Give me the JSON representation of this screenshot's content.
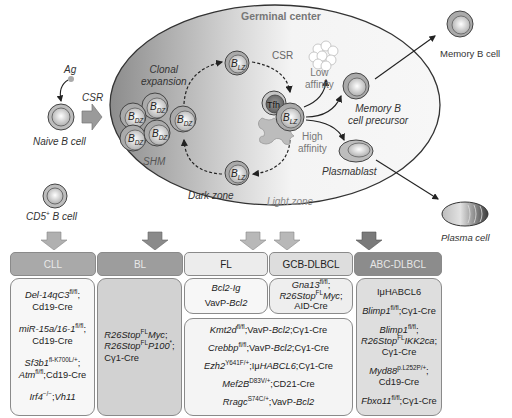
{
  "diagram": {
    "germinal_center": {
      "title": "Germinal center",
      "clonal_expansion": [
        "Clonal",
        "expansion"
      ],
      "shm": "SHM",
      "csr_inner": "CSR",
      "low_affinity": [
        "Low",
        "affinity"
      ],
      "high_affinity": [
        "High",
        "affinity"
      ],
      "dark_zone": "Dark zone",
      "light_zone": "Light zone",
      "tfh": "Tfh",
      "b_dz": "B",
      "b_dz_sub": "DZ",
      "b_lz": "B",
      "b_lz_sub": "LZ"
    },
    "left": {
      "ag": "Ag",
      "csr": "CSR",
      "naive_b_cell": "Naive B cell",
      "cd5_b_cell_prefix": "CD5",
      "cd5_sup": "+",
      "cd5_b_cell_suffix": " B cell"
    },
    "right": {
      "memory_b_cell": "Memory B cell",
      "memory_precursor": [
        "Memory B",
        "cell precursor"
      ],
      "plasmablast": "Plasmablast",
      "plasma_cell": "Plasma cell"
    },
    "colors": {
      "cll_header": "#a9a9a9",
      "bl_header": "#9d9d9d",
      "fl_header": "#ececec",
      "gcb_header": "#dddddd",
      "abc_header": "#8c8c8c",
      "arrow_light": "#b8b8b8",
      "arrow_dark": "#8a8a8a"
    }
  },
  "lymphomas": [
    {
      "name": "CLL",
      "models": [
        {
          "text": "Del-14qC3",
          "sup": "fl/fl",
          "rest": ";",
          "line2": "Cd19-Cre"
        },
        {
          "text": "miR-15a/16-1",
          "sup": "fl/fl",
          "rest": ";",
          "line2": "Cd19-Cre"
        },
        {
          "text": "Sf3b1",
          "sup": "fl-K700L/+",
          "rest": ";",
          "line2a": "Atm",
          "line2sup": "fl/fl",
          "line2b": ";Cd19-Cre"
        },
        {
          "text": "Irf4",
          "sup": "−/−",
          "rest": ";",
          "tail": "Vh11"
        }
      ]
    },
    {
      "name": "BL",
      "models": [
        {
          "a": "R26Stop",
          "sup": "FL",
          "b": "Myc",
          "c": ";"
        },
        {
          "a": "R26Stop",
          "sup": "FL",
          "b": "P100",
          "sup2": "*",
          "c": ";"
        },
        {
          "line": "Cγ1-Cre"
        }
      ]
    },
    {
      "name": "FL",
      "models": [
        {
          "line": "Bcl2-Ig"
        },
        {
          "a": "VavP-",
          "b": "Bcl2"
        }
      ]
    },
    {
      "name": "GCB-DLBCL",
      "models": [
        {
          "a": "Gna13",
          "sup": "fl/fl",
          "c": ";"
        },
        {
          "a": "R26Stop",
          "sup": "FL",
          "b": "Myc",
          "c": ";"
        },
        {
          "line": "AID-Cre"
        }
      ]
    },
    {
      "name": "ABC-DLBCL",
      "models": [
        {
          "line": "IμHABCL6"
        },
        {
          "a": "Blimp1",
          "sup": "fl/fl",
          "c": ";Cγ1-Cre"
        },
        {
          "a": "Blimp1",
          "sup": "fl/fl",
          "c": ";"
        },
        {
          "a": "R26Stop",
          "sup": "FL",
          "b": "IKK2ca",
          "c": ";"
        },
        {
          "line": "Cγ1-Cre"
        },
        {
          "a": "Myd88",
          "sup": "p.L252P/+",
          "c": ";"
        },
        {
          "line": "Cd19-Cre"
        },
        {
          "a": "Fbxo11",
          "sup": "fl/fl",
          "c": ";Cγ1-Cre"
        }
      ]
    }
  ],
  "shared_fl_gcb_models": [
    {
      "a": "Kmt2d",
      "sup": "fl/fl",
      "b": ";VavP-",
      "c": "Bcl2",
      "d": ";Cγ1-Cre"
    },
    {
      "a": "Crebbp",
      "sup": "fl/fl",
      "b": ";VavP-",
      "c": "Bcl2",
      "d": ";Cγ1-Cre"
    },
    {
      "a": "Ezh2",
      "sup": "Y641F/+",
      "b": ";Iμ",
      "c": "HABCL6",
      "d": ";Cγ1-Cre"
    },
    {
      "a": "Mef2B",
      "sup": "D83V/+",
      "b": ";CD21-Cre",
      "c": "",
      "d": ""
    },
    {
      "a": "Rragc",
      "sup": "S74C/+",
      "b": ";VavP-",
      "c": "Bcl2",
      "d": ""
    }
  ]
}
